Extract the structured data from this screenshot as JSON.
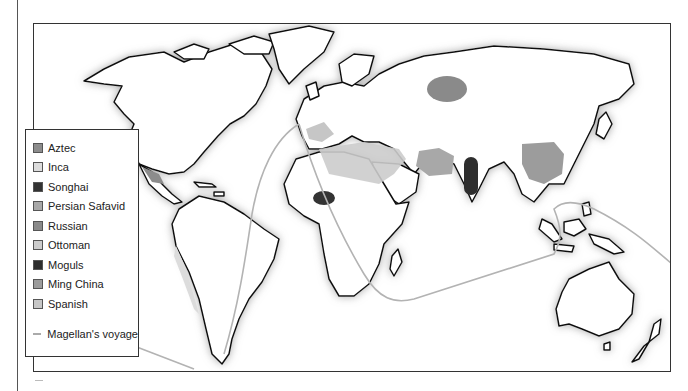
{
  "map": {
    "type": "world-empires-map",
    "colors": {
      "land_fill": "#ffffff",
      "coast_stroke": "#111111",
      "coast_shadow": "#9a9a9a",
      "route": "#b3b3b3"
    }
  },
  "legend": {
    "items": [
      {
        "label": "Aztec",
        "color": "#8c8c8c"
      },
      {
        "label": "Inca",
        "color": "#dcdcdc"
      },
      {
        "label": "Songhai",
        "color": "#333333"
      },
      {
        "label": "Persian Safavid",
        "color": "#a8a8a8"
      },
      {
        "label": "Russian",
        "color": "#8a8a8a"
      },
      {
        "label": "Ottoman",
        "color": "#cccccc"
      },
      {
        "label": "Moguls",
        "color": "#2e2e2e"
      },
      {
        "label": "Ming China",
        "color": "#9c9c9c"
      },
      {
        "label": "Spanish",
        "color": "#c6c6c6"
      }
    ],
    "route": {
      "label": "Magellan's voyage",
      "color": "#b3b3b3"
    }
  }
}
